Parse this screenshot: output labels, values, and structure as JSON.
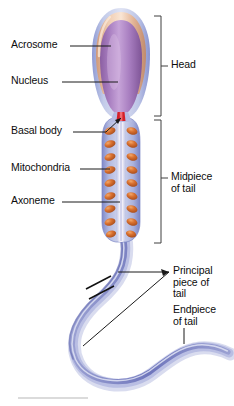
{
  "figure": {
    "background_color": "#ffffff"
  },
  "labels": {
    "acrosome": "Acrosome",
    "nucleus": "Nucleus",
    "basal_body": "Basal body",
    "mitochondria": "Mitochondria",
    "axoneme": "Axoneme",
    "head": "Head",
    "midpiece_line1": "Midpiece",
    "midpiece_line2": "of tail",
    "principal_line1": "Principal",
    "principal_line2": "piece of",
    "principal_line3": "tail",
    "endpiece_line1": "Endpiece",
    "endpiece_line2": "of tail"
  },
  "colors": {
    "acrosome": "#e7b394",
    "acrosome_highlight": "#f6dcc7",
    "nucleus": "#9a6fae",
    "nucleus_highlight": "#c9a6d6",
    "membrane": "#aeb7e2",
    "basal_body": "#d42029",
    "mitochondria": "#d2682f",
    "mitochondria_highlight": "#ee9a5c",
    "axoneme": "#e8e4f2",
    "tail": "#7b82c4",
    "tail_light": "#b9bede",
    "leader_line": "#1a1a1a",
    "bracket": "#4a4a4a",
    "footer_rule": "#b8b8b8",
    "text": "#0d0d0d"
  },
  "anatomy": {
    "regions": [
      {
        "name": "Head",
        "bracket_top": 16,
        "bracket_bottom": 116
      },
      {
        "name": "Midpiece of tail",
        "bracket_top": 120,
        "bracket_bottom": 243
      }
    ],
    "mitochondria_count_left": 9,
    "mitochondria_count_right": 9,
    "break_marks": 2
  }
}
